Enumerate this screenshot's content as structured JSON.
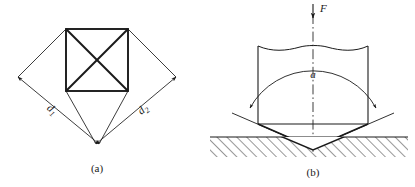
{
  "figure": {
    "stroke_color": "#1a1a1a",
    "accent_color": "#000000",
    "panels": [
      {
        "id": "panel-a",
        "caption": "(a)",
        "description": "Square indentation impression with diagonals",
        "labels": {
          "d1_base": "d",
          "d1_sub": "1",
          "d2_base": "d",
          "d2_sub": "2"
        }
      },
      {
        "id": "panel-b",
        "caption": "(b)",
        "description": "Pyramid indenter pressed into specimen surface",
        "labels": {
          "force": "F",
          "angle": "a"
        }
      }
    ]
  }
}
